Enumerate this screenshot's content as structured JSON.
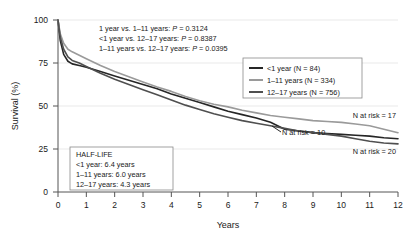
{
  "chart_data": {
    "type": "line",
    "title": "",
    "subtitle": "",
    "xlabel": "Years",
    "ylabel": "Survival (%)",
    "xlim": [
      0,
      12
    ],
    "ylim": [
      0,
      100
    ],
    "xticks": [
      "0",
      "1",
      "2",
      "3",
      "4",
      "5",
      "6",
      "7",
      "8",
      "9",
      "10",
      "11",
      "12"
    ],
    "yticks": [
      "0",
      "25",
      "50",
      "75",
      "100"
    ],
    "grid": "horizontal-light",
    "legend_position": "top-right",
    "series": [
      {
        "name": "<1 year (N = 84)",
        "short_name": "<1 year",
        "n": 84,
        "color": "#262626",
        "half_life_years": 6.4,
        "n_at_risk_label": "N at risk = 10",
        "x": [
          0,
          0.08,
          0.2,
          0.35,
          0.5,
          0.75,
          1.0,
          1.5,
          2.0,
          2.5,
          3.0,
          3.5,
          4.0,
          4.5,
          5.0,
          5.5,
          6.0,
          6.5,
          7.0,
          7.5,
          8.0,
          8.5,
          9.0,
          9.5,
          10.0,
          10.5,
          11.0,
          11.5,
          12.0
        ],
        "y": [
          100,
          88,
          80,
          76,
          74.5,
          73.5,
          72.5,
          70,
          67.5,
          65,
          62.5,
          60,
          57,
          54.5,
          52,
          49.5,
          47,
          45,
          43,
          40.5,
          36.5,
          35.5,
          34.5,
          34,
          33.5,
          33,
          32.5,
          31.5,
          31
        ]
      },
      {
        "name": "1–11 years (N = 334)",
        "short_name": "1–11 years",
        "n": 334,
        "color": "#9a9a9a",
        "half_life_years": 6.0,
        "n_at_risk_label": "N at risk = 17",
        "x": [
          0,
          0.08,
          0.2,
          0.35,
          0.5,
          0.75,
          1.0,
          1.5,
          2.0,
          2.5,
          3.0,
          3.5,
          4.0,
          4.5,
          5.0,
          5.5,
          6.0,
          6.5,
          7.0,
          7.5,
          8.0,
          8.5,
          9.0,
          9.5,
          10.0,
          10.5,
          11.0,
          11.5,
          12.0
        ],
        "y": [
          100,
          92,
          86.5,
          83,
          81.5,
          79.5,
          77.5,
          73.5,
          70,
          67,
          64,
          61,
          58.5,
          55.5,
          53,
          51,
          49.5,
          47.5,
          46,
          44.5,
          43.5,
          42.5,
          41.5,
          41,
          40.5,
          39.5,
          38.5,
          36.5,
          34.5
        ]
      },
      {
        "name": "12–17 years (N = 756)",
        "short_name": "12–17 years",
        "n": 756,
        "color": "#4f4f4f",
        "half_life_years": 4.3,
        "n_at_risk_label": "N at risk = 20",
        "x": [
          0,
          0.08,
          0.2,
          0.35,
          0.5,
          0.75,
          1.0,
          1.5,
          2.0,
          2.5,
          3.0,
          3.5,
          4.0,
          4.5,
          5.0,
          5.5,
          6.0,
          6.5,
          7.0,
          7.5,
          8.0,
          8.5,
          9.0,
          9.5,
          10.0,
          10.5,
          11.0,
          11.5,
          12.0
        ],
        "y": [
          100,
          90,
          83,
          78.5,
          76.5,
          75,
          73,
          69,
          65.5,
          62.5,
          59.5,
          56.5,
          53.5,
          50.5,
          48,
          45.5,
          43.5,
          41.5,
          40,
          38.5,
          37,
          35.5,
          34.5,
          33.5,
          32.5,
          31,
          29.5,
          28.5,
          28
        ]
      }
    ]
  },
  "annotations": {
    "pvalues": [
      "1 year vs. 1–11 years: ",
      "<1 year vs. 12–17 years: ",
      "1–11 years vs. 12–17 years: "
    ],
    "pvalue_p": "P",
    "pvalue_values": [
      " = 0.3124",
      " = 0.8387",
      " = 0.0395"
    ]
  },
  "halflife_box": {
    "title": "HALF-LIFE",
    "rows": [
      "<1 year: 6.4 years",
      "1–11 years: 6.0 years",
      "12–17 years: 4.3 years"
    ]
  },
  "legend": {
    "items": [
      "<1 year (N = 84)",
      "1–11 years (N = 334)",
      "12–17 years (N = 756)"
    ]
  },
  "nrisk_labels": {
    "top_right": "N at risk = 17",
    "middle": "N at risk = 10",
    "bottom_right": "N at risk = 20"
  }
}
